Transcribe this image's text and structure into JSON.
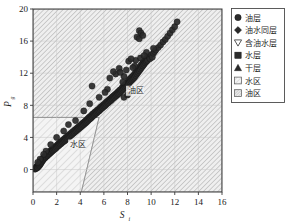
{
  "chart_data": {
    "type": "scatter",
    "title": "",
    "xlabel": "S",
    "xlabel_sub": "i",
    "ylabel": "P",
    "ylabel_sub": "g",
    "xlim": [
      0,
      16
    ],
    "ylim": [
      -2.8,
      20
    ],
    "xticks": [
      0,
      2,
      4,
      6,
      8,
      10,
      12,
      14,
      16
    ],
    "yticks": [
      0,
      4,
      8,
      12,
      16,
      20
    ],
    "xtick_labels": [
      "0",
      "2",
      "4",
      "6",
      "8",
      "10",
      "12",
      "14",
      "16"
    ],
    "ytick_labels": [
      "0",
      "4",
      "8",
      "12",
      "16",
      "20"
    ],
    "grid": true,
    "legend_position": "right-outside",
    "series": [
      {
        "name": "油层",
        "marker": "circle",
        "color": "#2b2b2b",
        "points": [
          [
            0.15,
            0.05
          ],
          [
            0.2,
            0.1
          ],
          [
            0.25,
            0.2
          ],
          [
            0.3,
            0.15
          ],
          [
            0.3,
            0.35
          ],
          [
            0.35,
            0.3
          ],
          [
            0.38,
            0.45
          ],
          [
            0.4,
            0.25
          ],
          [
            0.45,
            0.55
          ],
          [
            0.48,
            0.4
          ],
          [
            0.5,
            0.7
          ],
          [
            0.52,
            0.6
          ],
          [
            0.55,
            0.5
          ],
          [
            0.58,
            0.8
          ],
          [
            0.6,
            0.65
          ],
          [
            0.62,
            0.95
          ],
          [
            0.65,
            0.75
          ],
          [
            0.68,
            1.05
          ],
          [
            0.7,
            0.85
          ],
          [
            0.72,
            1.15
          ],
          [
            0.75,
            1.0
          ],
          [
            0.78,
            1.25
          ],
          [
            0.8,
            1.1
          ],
          [
            0.82,
            1.35
          ],
          [
            0.85,
            1.2
          ],
          [
            0.88,
            1.45
          ],
          [
            0.9,
            1.3
          ],
          [
            0.95,
            1.55
          ],
          [
            0.98,
            1.4
          ],
          [
            1.0,
            1.65
          ],
          [
            1.05,
            1.5
          ],
          [
            1.08,
            1.75
          ],
          [
            1.1,
            1.6
          ],
          [
            1.15,
            1.85
          ],
          [
            1.2,
            1.7
          ],
          [
            1.22,
            1.95
          ],
          [
            1.25,
            1.8
          ],
          [
            1.3,
            2.05
          ],
          [
            1.35,
            1.9
          ],
          [
            1.38,
            2.15
          ],
          [
            1.4,
            2.0
          ],
          [
            1.45,
            2.25
          ],
          [
            1.5,
            2.1
          ],
          [
            1.52,
            2.35
          ],
          [
            1.55,
            2.2
          ],
          [
            1.6,
            2.45
          ],
          [
            1.65,
            2.3
          ],
          [
            1.68,
            2.55
          ],
          [
            1.7,
            2.4
          ],
          [
            1.75,
            2.65
          ],
          [
            1.8,
            2.5
          ],
          [
            1.85,
            2.75
          ],
          [
            1.9,
            2.6
          ],
          [
            1.95,
            2.9
          ],
          [
            2.0,
            2.75
          ],
          [
            2.05,
            3.05
          ],
          [
            2.1,
            2.9
          ],
          [
            2.15,
            3.2
          ],
          [
            2.2,
            3.0
          ],
          [
            2.25,
            3.3
          ],
          [
            2.3,
            3.15
          ],
          [
            2.35,
            3.45
          ],
          [
            2.4,
            3.25
          ],
          [
            2.45,
            3.55
          ],
          [
            2.5,
            3.4
          ],
          [
            2.55,
            3.7
          ],
          [
            2.6,
            3.5
          ],
          [
            2.65,
            3.8
          ],
          [
            2.7,
            3.6
          ],
          [
            2.75,
            3.95
          ],
          [
            2.8,
            3.75
          ],
          [
            2.85,
            4.05
          ],
          [
            2.9,
            3.85
          ],
          [
            2.95,
            4.2
          ],
          [
            3.0,
            4.0
          ],
          [
            3.05,
            4.3
          ],
          [
            3.1,
            4.1
          ],
          [
            3.15,
            4.45
          ],
          [
            3.2,
            4.25
          ],
          [
            3.25,
            4.55
          ],
          [
            3.3,
            4.35
          ],
          [
            3.35,
            4.7
          ],
          [
            3.4,
            4.5
          ],
          [
            3.45,
            4.8
          ],
          [
            3.5,
            4.6
          ],
          [
            3.55,
            4.95
          ],
          [
            3.6,
            4.75
          ],
          [
            3.65,
            5.05
          ],
          [
            3.7,
            4.85
          ],
          [
            3.75,
            5.2
          ],
          [
            3.8,
            5.0
          ],
          [
            3.85,
            5.3
          ],
          [
            3.9,
            5.1
          ],
          [
            3.95,
            5.45
          ],
          [
            4.0,
            5.25
          ],
          [
            4.05,
            5.55
          ],
          [
            4.1,
            5.35
          ],
          [
            4.15,
            5.7
          ],
          [
            4.2,
            5.5
          ],
          [
            4.25,
            5.8
          ],
          [
            4.3,
            5.6
          ],
          [
            4.35,
            5.95
          ],
          [
            4.4,
            5.75
          ],
          [
            4.45,
            6.05
          ],
          [
            4.5,
            5.85
          ],
          [
            4.55,
            6.2
          ],
          [
            4.6,
            6.0
          ],
          [
            4.65,
            6.35
          ],
          [
            4.7,
            6.15
          ],
          [
            4.75,
            6.5
          ],
          [
            4.8,
            6.3
          ],
          [
            4.85,
            6.6
          ],
          [
            4.9,
            6.4
          ],
          [
            4.95,
            6.75
          ],
          [
            5.0,
            6.55
          ],
          [
            5.05,
            6.9
          ],
          [
            5.1,
            6.7
          ],
          [
            5.15,
            7.0
          ],
          [
            5.2,
            6.8
          ],
          [
            5.25,
            7.15
          ],
          [
            5.3,
            6.95
          ],
          [
            5.35,
            7.25
          ],
          [
            5.4,
            7.05
          ],
          [
            5.45,
            7.4
          ],
          [
            5.5,
            7.2
          ],
          [
            5.55,
            7.5
          ],
          [
            5.6,
            7.3
          ],
          [
            5.65,
            7.65
          ],
          [
            5.7,
            7.45
          ],
          [
            5.75,
            7.8
          ],
          [
            5.8,
            7.6
          ],
          [
            5.85,
            7.9
          ],
          [
            5.9,
            7.7
          ],
          [
            5.95,
            8.05
          ],
          [
            6.0,
            7.85
          ],
          [
            6.05,
            8.15
          ],
          [
            6.1,
            7.95
          ],
          [
            6.15,
            8.3
          ],
          [
            6.2,
            8.1
          ],
          [
            6.25,
            8.45
          ],
          [
            6.3,
            8.25
          ],
          [
            6.35,
            8.55
          ],
          [
            6.4,
            8.35
          ],
          [
            6.45,
            8.7
          ],
          [
            6.5,
            8.5
          ],
          [
            6.55,
            8.8
          ],
          [
            6.6,
            8.6
          ],
          [
            6.65,
            8.95
          ],
          [
            6.7,
            8.75
          ],
          [
            6.75,
            9.1
          ],
          [
            6.8,
            8.9
          ],
          [
            6.85,
            9.2
          ],
          [
            6.9,
            9.0
          ],
          [
            6.95,
            9.35
          ],
          [
            7.0,
            9.15
          ],
          [
            7.05,
            9.45
          ],
          [
            7.1,
            9.25
          ],
          [
            7.15,
            9.6
          ],
          [
            7.2,
            9.4
          ],
          [
            7.25,
            9.75
          ],
          [
            7.3,
            9.5
          ],
          [
            7.35,
            9.9
          ],
          [
            7.4,
            9.65
          ],
          [
            7.45,
            10.0
          ],
          [
            7.5,
            9.8
          ],
          [
            7.55,
            10.2
          ],
          [
            7.6,
            9.95
          ],
          [
            7.65,
            10.35
          ],
          [
            7.7,
            10.1
          ],
          [
            7.75,
            10.5
          ],
          [
            7.8,
            10.25
          ],
          [
            7.85,
            10.65
          ],
          [
            7.9,
            10.4
          ],
          [
            7.95,
            10.8
          ],
          [
            8.0,
            10.55
          ],
          [
            8.05,
            11.0
          ],
          [
            8.1,
            10.7
          ],
          [
            8.15,
            11.2
          ],
          [
            8.2,
            10.9
          ],
          [
            8.25,
            11.35
          ],
          [
            8.3,
            11.05
          ],
          [
            8.35,
            11.5
          ],
          [
            8.4,
            11.2
          ],
          [
            8.45,
            11.65
          ],
          [
            8.5,
            11.35
          ],
          [
            8.55,
            11.8
          ],
          [
            8.6,
            11.5
          ],
          [
            8.65,
            12.0
          ],
          [
            8.7,
            11.7
          ],
          [
            8.75,
            12.2
          ],
          [
            8.8,
            11.9
          ],
          [
            8.85,
            12.4
          ],
          [
            8.9,
            12.1
          ],
          [
            8.95,
            12.6
          ],
          [
            9.0,
            12.3
          ],
          [
            9.05,
            12.8
          ],
          [
            9.1,
            12.5
          ],
          [
            9.15,
            13.0
          ],
          [
            9.2,
            12.7
          ],
          [
            9.25,
            13.2
          ],
          [
            9.3,
            12.9
          ],
          [
            9.35,
            13.4
          ],
          [
            9.4,
            13.1
          ],
          [
            9.45,
            13.55
          ],
          [
            9.5,
            13.3
          ],
          [
            9.55,
            13.7
          ],
          [
            9.6,
            13.45
          ],
          [
            9.65,
            13.9
          ],
          [
            9.7,
            13.6
          ],
          [
            9.8,
            14.1
          ],
          [
            9.9,
            13.8
          ],
          [
            10.0,
            14.3
          ],
          [
            10.1,
            14.0
          ],
          [
            10.2,
            14.5
          ],
          [
            10.3,
            14.7
          ],
          [
            10.4,
            14.9
          ],
          [
            10.6,
            15.2
          ],
          [
            10.8,
            15.5
          ],
          [
            11.0,
            15.9
          ],
          [
            11.2,
            16.2
          ],
          [
            11.4,
            16.6
          ],
          [
            11.6,
            17.0
          ],
          [
            11.8,
            17.4
          ],
          [
            12.0,
            17.8
          ],
          [
            12.2,
            18.4
          ],
          [
            9.0,
            17.3
          ],
          [
            9.15,
            17.0
          ],
          [
            8.8,
            16.5
          ],
          [
            9.0,
            16.3
          ],
          [
            9.3,
            16.7
          ],
          [
            8.7,
            13.6
          ],
          [
            7.3,
            12.6
          ],
          [
            6.5,
            11.4
          ],
          [
            5.0,
            10.4
          ],
          [
            6.3,
            10.0
          ],
          [
            7.7,
            11.6
          ],
          [
            8.1,
            13.5
          ],
          [
            8.3,
            13.8
          ],
          [
            9.6,
            14.6
          ],
          [
            10.2,
            15.1
          ],
          [
            7.0,
            11.9
          ],
          [
            7.4,
            12.1
          ],
          [
            6.8,
            12.2
          ],
          [
            7.9,
            12.4
          ],
          [
            8.6,
            12.9
          ],
          [
            9.1,
            13.9
          ],
          [
            5.6,
            9.0
          ],
          [
            6.1,
            9.6
          ],
          [
            4.3,
            7.3
          ],
          [
            4.8,
            8.2
          ],
          [
            3.6,
            6.1
          ],
          [
            3.0,
            5.6
          ],
          [
            2.6,
            4.8
          ],
          [
            2.0,
            4.0
          ],
          [
            1.5,
            3.1
          ],
          [
            1.1,
            2.3
          ],
          [
            0.9,
            1.9
          ],
          [
            0.6,
            1.3
          ],
          [
            0.4,
            0.9
          ],
          [
            7.7,
            9.0
          ],
          [
            8.0,
            9.3
          ],
          [
            7.6,
            10.9
          ],
          [
            8.45,
            12.7
          ],
          [
            9.4,
            14.2
          ]
        ]
      }
    ],
    "regions": [
      {
        "name": "水区",
        "label": "水区",
        "hatch": "light-diagonal",
        "vertices": [
          [
            0,
            -2.8
          ],
          [
            0,
            6.5
          ],
          [
            5.6,
            6.5
          ],
          [
            4.1,
            -2.8
          ]
        ]
      },
      {
        "name": "油区",
        "label": "油区",
        "hatch": "dense-diagonal",
        "vertices": [
          [
            0,
            6.5
          ],
          [
            0,
            20
          ],
          [
            16,
            20
          ],
          [
            16,
            -2.8
          ],
          [
            4.1,
            -2.8
          ],
          [
            5.6,
            6.5
          ]
        ]
      }
    ],
    "annotations": [
      {
        "text": "油区",
        "x": 8.0,
        "y": 9.5
      },
      {
        "text": "水区",
        "x": 3.1,
        "y": 2.8
      }
    ]
  },
  "legend": {
    "items": [
      {
        "label": "油层",
        "marker": "circle",
        "color": "#2b2b2b"
      },
      {
        "label": "油水同层",
        "marker": "diamond",
        "color": "#2b2b2b"
      },
      {
        "label": "含油水层",
        "marker": "triangle-down",
        "color": "#4a4a4a"
      },
      {
        "label": "水层",
        "marker": "square",
        "color": "#2b2b2b"
      },
      {
        "label": "干层",
        "marker": "triangle-up",
        "color": "#2b2b2b"
      },
      {
        "label": "水区",
        "marker": "swatch-light-hatch",
        "color": "#e8e8e8"
      },
      {
        "label": "油区",
        "marker": "swatch-dense-hatch",
        "color": "#d0d0d0"
      }
    ]
  },
  "colors": {
    "marker": "#2b2b2b",
    "axis": "#3a3a3a",
    "grid": "#c8c8c8",
    "region_light": "#f0f0f0",
    "region_dense": "#e2e2e2",
    "hatch_line": "#a8a8a8",
    "text": "#1a1a1a"
  }
}
